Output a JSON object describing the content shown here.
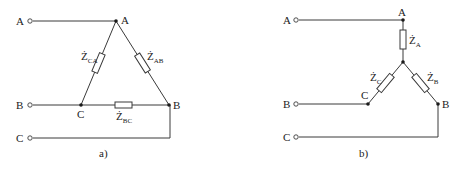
{
  "figure_a": {
    "caption": "a)",
    "configuration": "delta",
    "terminals": [
      "A",
      "B",
      "C"
    ],
    "nodes": [
      "A",
      "B",
      "C"
    ],
    "impedances": [
      {
        "symbol": "Ż",
        "sub": "CA"
      },
      {
        "symbol": "Ż",
        "sub": "AB"
      },
      {
        "symbol": "Ż",
        "sub": "BC"
      }
    ]
  },
  "figure_b": {
    "caption": "b)",
    "configuration": "wye",
    "terminals": [
      "A",
      "B",
      "C"
    ],
    "nodes": [
      "A",
      "B",
      "C"
    ],
    "impedances": [
      {
        "symbol": "Ż",
        "sub": "A"
      },
      {
        "symbol": "Ż",
        "sub": "B"
      },
      {
        "symbol": "Ż",
        "sub": "C"
      }
    ]
  }
}
